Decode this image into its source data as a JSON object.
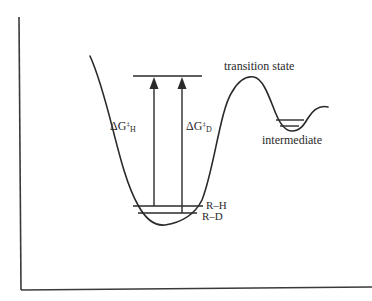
{
  "diagram": {
    "type": "reaction-energy-profile",
    "labels": {
      "transition_state": "transition state",
      "intermediate": "intermediate",
      "reactant_h": "R–H",
      "reactant_d": "R–D",
      "dg_h": {
        "delta": "ΔG",
        "sup": "‡",
        "sub": "H"
      },
      "dg_d": {
        "delta": "ΔG",
        "sup": "‡",
        "sub": "D"
      }
    },
    "colors": {
      "line": "#2a2a2a",
      "background": "#ffffff"
    }
  }
}
